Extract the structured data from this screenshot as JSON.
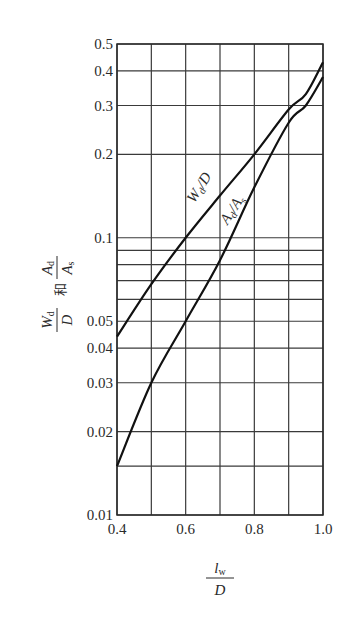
{
  "chart_data": {
    "type": "line",
    "title": "",
    "xlabel": "l_w / D",
    "xlabel_parts": {
      "numerator": "l",
      "numerator_sub": "w",
      "denominator": "D"
    },
    "ylabel": "W_d/D 和 A_d/A_s",
    "ylabel_parts": {
      "w": "W",
      "w_sub": "d",
      "d": "D",
      "and": "和",
      "a": "A",
      "a_sub": "d",
      "as": "A",
      "as_sub": "s"
    },
    "x_scale": "linear",
    "y_scale": "log",
    "xlim": [
      0.4,
      1.0
    ],
    "ylim": [
      0.01,
      0.5
    ],
    "grid": true,
    "legend": "inline labels on curves",
    "x_ticks": [
      0.4,
      0.5,
      0.6,
      0.7,
      0.8,
      0.9,
      1.0
    ],
    "x_tick_labels": [
      "0.4",
      "",
      "0.6",
      "",
      "0.8",
      "",
      "1.0"
    ],
    "y_gridlines": [
      0.5,
      0.4,
      0.3,
      0.2,
      0.1,
      0.09,
      0.08,
      0.07,
      0.06,
      0.05,
      0.04,
      0.03,
      0.02,
      0.015,
      0.01
    ],
    "y_tick_labels": [
      {
        "value": 0.5,
        "label": "0.5"
      },
      {
        "value": 0.4,
        "label": "0.4"
      },
      {
        "value": 0.3,
        "label": "0.3"
      },
      {
        "value": 0.2,
        "label": "0.2"
      },
      {
        "value": 0.1,
        "label": "0.1"
      },
      {
        "value": 0.05,
        "label": "0.05"
      },
      {
        "value": 0.04,
        "label": "0.04"
      },
      {
        "value": 0.03,
        "label": "0.03"
      },
      {
        "value": 0.02,
        "label": "0.02"
      },
      {
        "value": 0.01,
        "label": "0.01"
      }
    ],
    "x": [
      0.4,
      0.5,
      0.6,
      0.7,
      0.8,
      0.9,
      0.95,
      1.0
    ],
    "series": [
      {
        "name": "Wd/D",
        "label_main": "W",
        "label_sub": "d",
        "label_tail": "/D",
        "values": [
          0.044,
          0.068,
          0.1,
          0.142,
          0.2,
          0.29,
          0.33,
          0.43
        ]
      },
      {
        "name": "Ad/As",
        "label_main": "A",
        "label_sub": "d",
        "label_tail": "/A",
        "label_tail_sub": "s",
        "values": [
          0.015,
          0.03,
          0.05,
          0.083,
          0.152,
          0.26,
          0.3,
          0.38
        ]
      }
    ]
  }
}
